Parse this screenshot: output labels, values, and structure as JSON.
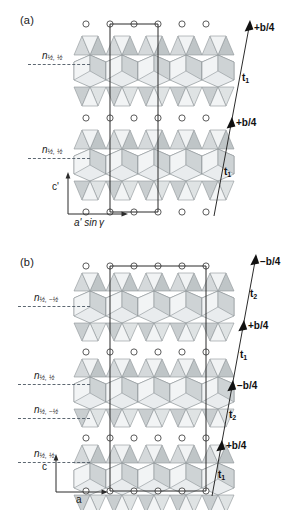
{
  "figure": {
    "background": "#ffffff",
    "ink": "#1a1a1a",
    "polyhedron_light": "#eceff0",
    "polyhedron_mid": "#d9dcdd",
    "polyhedron_dark": "#bcc1c3",
    "dashdot_color": "#55606b"
  },
  "panels": [
    {
      "id": "a",
      "label": "(a)",
      "axes": {
        "vertical": "c'",
        "horizontal_prefix": "a' sin",
        "horizontal_symbol": "γ"
      },
      "nplanes": [
        {
          "label_n": "n",
          "sub": "½, ½"
        },
        {
          "label_n": "n",
          "sub": "½, ½"
        }
      ],
      "vectors": [
        {
          "shift": "+b/4",
          "t": "t",
          "t_sub": "1"
        },
        {
          "shift": "+b/4",
          "t": "t",
          "t_sub": "1"
        }
      ]
    },
    {
      "id": "b",
      "label": "(b)",
      "axes": {
        "vertical": "c",
        "horizontal_prefix": "a",
        "horizontal_symbol": ""
      },
      "nplanes": [
        {
          "label_n": "n",
          "sub": "½, −½"
        },
        {
          "label_n": "n",
          "sub": "½, ½"
        },
        {
          "label_n": "n",
          "sub": "½, −½"
        },
        {
          "label_n": "n",
          "sub": "½, ½"
        }
      ],
      "vectors": [
        {
          "shift": "−b/4",
          "t": "t",
          "t_sub": "2"
        },
        {
          "shift": "+b/4",
          "t": "t",
          "t_sub": "1"
        },
        {
          "shift": "−b/4",
          "t": "t",
          "t_sub": "2"
        },
        {
          "shift": "+b/4",
          "t": "t",
          "t_sub": "1"
        }
      ]
    }
  ]
}
